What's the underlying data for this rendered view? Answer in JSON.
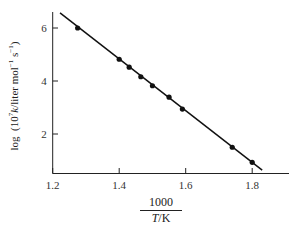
{
  "chart_data": {
    "type": "scatter",
    "title": "",
    "xlabel": "1000 / (T/K)",
    "xlabel_numerator": "1000",
    "xlabel_denominator": "T/K",
    "ylabel": "log (10^7 k / liter mol^-1 s^-1)",
    "xlim": [
      1.2,
      1.9
    ],
    "ylim": [
      0.5,
      6.6
    ],
    "xticks": [
      1.2,
      1.4,
      1.6,
      1.8
    ],
    "xtick_labels": [
      "1.2",
      "1.4",
      "1.6",
      "1.8"
    ],
    "yticks": [
      2,
      4,
      6
    ],
    "ytick_labels": [
      "2",
      "4",
      "6"
    ],
    "grid": false,
    "legend": null,
    "series": [
      {
        "name": "data",
        "x": [
          1.275,
          1.4,
          1.43,
          1.465,
          1.5,
          1.55,
          1.59,
          1.74,
          1.8
        ],
        "y": [
          6.0,
          4.82,
          4.52,
          4.16,
          3.82,
          3.39,
          2.94,
          1.5,
          0.93
        ]
      },
      {
        "name": "fit-line",
        "x": [
          1.222,
          1.83
        ],
        "y": [
          6.57,
          0.64
        ]
      }
    ]
  },
  "labels": {
    "x_num": "1000",
    "x_den_var": "T",
    "x_den_unit": "/K",
    "y_log": "log",
    "y_open": "(",
    "y_ten": "10",
    "y_ten_exp": "7",
    "y_k": "k",
    "y_unit": "/liter mol",
    "y_exp1": "−1",
    "y_s": " s",
    "y_exp2": "−1",
    "y_close": ")"
  }
}
